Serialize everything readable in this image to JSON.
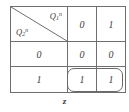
{
  "figure": {
    "caption": "z",
    "header_cell": {
      "top_label_base": "Q",
      "top_label_sub": "1",
      "top_label_sup": "n",
      "bottom_label_base": "Q",
      "bottom_label_sub": "2",
      "bottom_label_sup": "n",
      "diagonal": "top-left-to-bottom-right"
    },
    "colors": {
      "border": "#6e6e6e",
      "text": "#3d3d3c",
      "background": "#ffffff",
      "group_outline": "#6a6a6a"
    }
  },
  "table": {
    "rows": [
      {
        "label_type": "diagonal-header",
        "cells": [
          "0",
          "1"
        ]
      },
      {
        "label_type": "value",
        "row_label": "0",
        "cells": [
          "0",
          "0"
        ]
      },
      {
        "label_type": "value",
        "row_label": "1",
        "cells": [
          "1",
          "1"
        ]
      }
    ]
  },
  "group": {
    "label": "implicant-group",
    "covers": [
      "row3-col2",
      "row3-col3"
    ]
  }
}
